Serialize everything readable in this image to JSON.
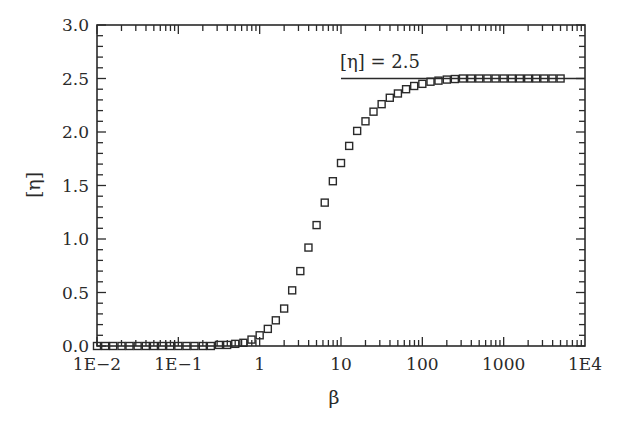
{
  "chart_data": {
    "type": "scatter",
    "title": "",
    "xlabel": "β",
    "ylabel": "[η]",
    "xscale": "log",
    "xlim": [
      0.01,
      10000
    ],
    "ylim": [
      0.0,
      3.0
    ],
    "grid": false,
    "legend": null,
    "x_tick_labels": [
      "1E−2",
      "1E−1",
      "1",
      "10",
      "100",
      "1000",
      "1E4"
    ],
    "x_tick_values": [
      0.01,
      0.1,
      1,
      10,
      100,
      1000,
      10000
    ],
    "y_tick_labels": [
      "0.0",
      "0.5",
      "1.0",
      "1.5",
      "2.0",
      "2.5",
      "3.0"
    ],
    "y_tick_values": [
      0.0,
      0.5,
      1.0,
      1.5,
      2.0,
      2.5,
      3.0
    ],
    "annotation": {
      "text": "[η] = 2.5",
      "line_y": 2.5,
      "line_x_start": 10,
      "line_x_end": 10000
    },
    "series": [
      {
        "name": "[η] vs β",
        "marker": "open-square",
        "x": [
          0.01,
          0.0126,
          0.0158,
          0.02,
          0.0251,
          0.0316,
          0.0398,
          0.0501,
          0.0631,
          0.0794,
          0.1,
          0.126,
          0.158,
          0.2,
          0.251,
          0.316,
          0.398,
          0.501,
          0.631,
          0.794,
          1.0,
          1.26,
          1.58,
          2.0,
          2.51,
          3.16,
          3.98,
          5.01,
          6.31,
          7.94,
          10,
          12.6,
          15.8,
          20,
          25.1,
          31.6,
          39.8,
          50.1,
          63.1,
          79.4,
          100,
          126,
          158,
          200,
          251,
          316,
          398,
          501,
          631,
          794,
          1000,
          1260,
          1580,
          2000,
          2510,
          3160,
          3980,
          5010
        ],
        "y": [
          0.0,
          0.0,
          0.0,
          0.0,
          0.0,
          0.0,
          0.0,
          0.0,
          0.0,
          0.0,
          0.0,
          0.0,
          0.0,
          0.0,
          0.0,
          0.01,
          0.01,
          0.02,
          0.03,
          0.06,
          0.1,
          0.16,
          0.24,
          0.35,
          0.52,
          0.7,
          0.92,
          1.13,
          1.34,
          1.54,
          1.71,
          1.87,
          2.01,
          2.1,
          2.19,
          2.26,
          2.32,
          2.36,
          2.4,
          2.43,
          2.45,
          2.47,
          2.48,
          2.49,
          2.495,
          2.5,
          2.5,
          2.5,
          2.5,
          2.5,
          2.5,
          2.5,
          2.5,
          2.5,
          2.5,
          2.5,
          2.5,
          2.5
        ]
      }
    ]
  }
}
